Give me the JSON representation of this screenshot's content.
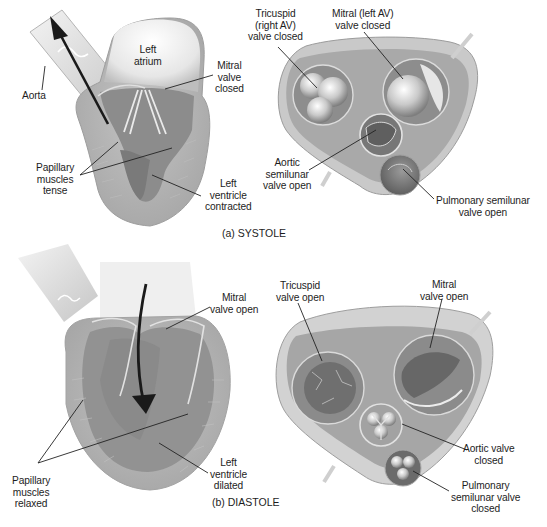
{
  "figure": {
    "panels": [
      {
        "id": "systole",
        "caption": "(a)  SYSTOLE",
        "caption_pos": [
          222,
          233
        ],
        "labels": [
          {
            "id": "aorta",
            "lines": [
              "Aorta"
            ],
            "pos": [
              22,
              90
            ],
            "leader": [
              [
                42,
                90
              ],
              [
                45,
                66
              ]
            ]
          },
          {
            "id": "left-atrium",
            "lines": [
              "Left",
              "atrium"
            ],
            "pos": [
              134,
              44
            ],
            "leader": null
          },
          {
            "id": "mitral-valve-closed",
            "lines": [
              "Mitral",
              "valve",
              "closed"
            ],
            "pos": [
              215,
              60
            ],
            "leader": [
              [
                213,
                75
              ],
              [
                165,
                89
              ]
            ]
          },
          {
            "id": "papillary-muscles-tense",
            "lines": [
              "Papillary",
              "muscles",
              "tense"
            ],
            "pos": [
              36,
              162
            ],
            "leader": [
              [
                80,
                175
              ],
              [
                118,
                142
              ]
            ],
            "leader2": [
              [
                80,
                175
              ],
              [
                172,
                148
              ]
            ]
          },
          {
            "id": "left-ventricle-contracted",
            "lines": [
              "Left",
              "ventricle",
              "contracted"
            ],
            "pos": [
              205,
              178
            ],
            "leader": [
              [
                201,
                196
              ],
              [
                152,
                175
              ]
            ]
          },
          {
            "id": "tricuspid-right-av-closed",
            "lines": [
              "Tricuspid",
              "(right AV)",
              "valve closed"
            ],
            "pos": [
              248,
              8
            ],
            "leader": [
              [
                278,
                47
              ],
              [
                317,
                88
              ]
            ]
          },
          {
            "id": "mitral-left-av-closed",
            "lines": [
              "Mitral (left AV)",
              "valve closed"
            ],
            "pos": [
              332,
              8
            ],
            "leader": [
              [
                364,
                32
              ],
              [
                403,
                79
              ]
            ]
          },
          {
            "id": "aortic-semilunar-open",
            "lines": [
              "Aortic",
              "semilunar",
              "valve open"
            ],
            "pos": [
              263,
              157
            ],
            "leader": [
              [
                309,
                170
              ],
              [
                376,
                130
              ]
            ]
          },
          {
            "id": "pulmonary-semilunar-open",
            "lines": [
              "Pulmonary semilunar",
              "valve open"
            ],
            "pos": [
              436,
              195
            ],
            "leader": [
              [
                434,
                199
              ],
              [
                403,
                169
              ]
            ]
          }
        ]
      },
      {
        "id": "diastole",
        "caption": "(b)  DIASTOLE",
        "caption_pos": [
          212,
          502
        ],
        "labels": [
          {
            "id": "mitral-valve-open",
            "lines": [
              "Mitral",
              "valve open"
            ],
            "pos": [
              210,
              292
            ],
            "leader": [
              [
                210,
                307
              ],
              [
                166,
                329
              ]
            ]
          },
          {
            "id": "papillary-muscles-relaxed",
            "lines": [
              "Papillary",
              "muscles",
              "relaxed"
            ],
            "pos": [
              12,
              475
            ],
            "leader": [
              [
                38,
                463
              ],
              [
                83,
                400
              ]
            ],
            "leader2": [
              [
                38,
                463
              ],
              [
                188,
                414
              ]
            ]
          },
          {
            "id": "left-ventricle-dilated",
            "lines": [
              "Left",
              "ventricle",
              "dilated"
            ],
            "pos": [
              210,
              457
            ],
            "leader": [
              [
                208,
                473
              ],
              [
                159,
                443
              ]
            ]
          },
          {
            "id": "tricuspid-valve-open",
            "lines": [
              "Tricuspid",
              "valve open"
            ],
            "pos": [
              276,
              280
            ],
            "leader": [
              [
                298,
                303
              ],
              [
                322,
                361
              ]
            ]
          },
          {
            "id": "mitral-valve-open-2",
            "lines": [
              "Mitral",
              "valve open"
            ],
            "pos": [
              420,
              279
            ],
            "leader": [
              [
                442,
                299
              ],
              [
                430,
                348
              ]
            ]
          },
          {
            "id": "aortic-valve-closed",
            "lines": [
              "Aortic valve",
              "closed"
            ],
            "pos": [
              463,
              443
            ],
            "leader": [
              [
                467,
                450
              ],
              [
                402,
                424
              ]
            ]
          },
          {
            "id": "pulmonary-semilunar-closed",
            "lines": [
              "Pulmonary",
              "semilunar valve",
              "closed"
            ],
            "pos": [
              451,
              480
            ],
            "leader": [
              [
                449,
                491
              ],
              [
                413,
                471
              ]
            ]
          }
        ]
      }
    ]
  },
  "colors": {
    "background": "#ffffff",
    "tissue_light": "#d9d9d9",
    "tissue_mid": "#b3b3b3",
    "tissue_dark": "#8a8a8a",
    "chamber_dark": "#7d7d7d",
    "valve_highlight": "#eeeeee",
    "arrow": "#1a1a1a",
    "text": "#1d1d1d"
  }
}
